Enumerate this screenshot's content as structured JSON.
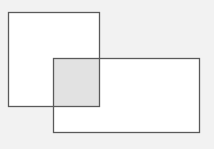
{
  "canvas": {
    "width": 214,
    "height": 149,
    "background": "#f2f2f2"
  },
  "colors": {
    "stroke": "#5a5a5a",
    "fill": "#ffffff",
    "overlap_fill": "#e2e2e2"
  },
  "shapes": [
    {
      "id": "rect-a",
      "x": 8,
      "y": 12,
      "width": 91,
      "height": 94
    },
    {
      "id": "rect-b",
      "x": 53,
      "y": 58,
      "width": 146,
      "height": 74
    }
  ],
  "overlap": {
    "x": 53,
    "y": 58,
    "width": 46,
    "height": 48
  }
}
